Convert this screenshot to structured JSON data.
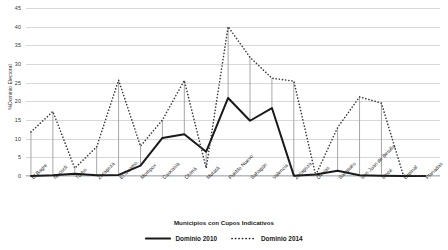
{
  "chart_data": {
    "type": "line",
    "title": "",
    "xlabel": "Municipios con Cupos Indicativos",
    "ylabel": "%Dominio Electoral",
    "ylim": [
      0,
      45
    ],
    "ytick_step": 5,
    "yticks": [
      0,
      5,
      10,
      15,
      20,
      25,
      30,
      35,
      40,
      45
    ],
    "grid": true,
    "legend_position": "bottom",
    "categories": [
      "El Bagre",
      "Necoclí",
      "Turbo",
      "Zaragoza",
      "El Guamo",
      "Mompox",
      "Caucasia",
      "Chimá",
      "Mutatá",
      "Pueblo Nuevo",
      "Sahagún",
      "Valencia",
      "Zaragoza",
      "Ovejas",
      "Sampués",
      "San Juan de Betulia",
      "Sincé",
      "Espinal",
      "Planadas"
    ],
    "series": [
      {
        "name": "Dominio 2010",
        "style": "solid",
        "color": "#1a1a1a",
        "values": [
          0.0,
          0.2,
          0.6,
          0.2,
          0.3,
          2.8,
          10.2,
          11.2,
          6.5,
          20.9,
          14.8,
          18.2,
          0.1,
          0.4,
          1.4,
          0.2,
          0.1,
          0.0,
          0.0
        ]
      },
      {
        "name": "Dominio 2014",
        "style": "dotted",
        "color": "#3a3a3a",
        "values": [
          11.8,
          17.3,
          2.1,
          7.8,
          25.7,
          8.0,
          15.0,
          25.6,
          2.1,
          40.0,
          31.8,
          26.2,
          25.4,
          0.2,
          13.0,
          21.2,
          19.5,
          0.2,
          0.0
        ]
      }
    ]
  },
  "legend": {
    "items": [
      {
        "label": "Dominio 2010",
        "style": "solid"
      },
      {
        "label": "Dominio 2014",
        "style": "dotted"
      }
    ]
  }
}
